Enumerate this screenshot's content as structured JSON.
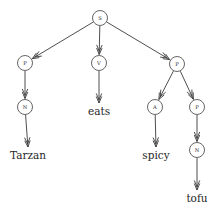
{
  "diagram": {
    "type": "parse-tree",
    "sentence": "Tarzan eats spicy tofu",
    "colors": {
      "background": "#ffffff",
      "stroke": "#3a3a3a",
      "node_stroke": "#4a4a4a",
      "node_fill": "#ffffff",
      "label_text": "#2b2b2b",
      "leaf_text": "#262626"
    },
    "nodes": [
      {
        "id": "s",
        "label": "S",
        "x": 100,
        "y": 18,
        "r": 7.5
      },
      {
        "id": "np1",
        "label": "P",
        "x": 25,
        "y": 63,
        "r": 7.5
      },
      {
        "id": "v",
        "label": "V",
        "x": 99,
        "y": 63,
        "r": 7.5
      },
      {
        "id": "np2",
        "label": "P",
        "x": 177,
        "y": 64,
        "r": 7.5
      },
      {
        "id": "n1",
        "label": "N",
        "x": 25,
        "y": 107,
        "r": 7.5
      },
      {
        "id": "a",
        "label": "A",
        "x": 155,
        "y": 107,
        "r": 7.5
      },
      {
        "id": "np3",
        "label": "P",
        "x": 197,
        "y": 107,
        "r": 7.5
      },
      {
        "id": "n2",
        "label": "N",
        "x": 197,
        "y": 150,
        "r": 7.5
      }
    ],
    "leaves": [
      {
        "id": "leaf-tarzan",
        "label": "Tarzan",
        "x": 28,
        "y": 159
      },
      {
        "id": "leaf-eats",
        "label": "eats",
        "x": 99,
        "y": 115
      },
      {
        "id": "leaf-spicy",
        "label": "spicy",
        "x": 156,
        "y": 159
      },
      {
        "id": "leaf-tofu",
        "label": "tofu",
        "x": 197,
        "y": 202
      }
    ],
    "edges": [
      {
        "id": "edge-s-np1",
        "from": "s",
        "to": "np1",
        "label": "S to left P"
      },
      {
        "id": "edge-s-v",
        "from": "s",
        "to": "v",
        "label": "S to V"
      },
      {
        "id": "edge-s-np2",
        "from": "s",
        "to": "np2",
        "label": "S to right P"
      },
      {
        "id": "edge-np1-n1",
        "from": "np1",
        "to": "n1",
        "label": "left P to N"
      },
      {
        "id": "edge-n1-tarzan",
        "from": "n1",
        "to": "leaf-tarzan",
        "label": "N to Tarzan"
      },
      {
        "id": "edge-v-eats",
        "from": "v",
        "to": "leaf-eats",
        "label": "V to eats"
      },
      {
        "id": "edge-np2-a",
        "from": "np2",
        "to": "a",
        "label": "right P to A"
      },
      {
        "id": "edge-np2-np3",
        "from": "np2",
        "to": "np3",
        "label": "right P to lower P"
      },
      {
        "id": "edge-a-spicy",
        "from": "a",
        "to": "leaf-spicy",
        "label": "A to spicy"
      },
      {
        "id": "edge-np3-n2",
        "from": "np3",
        "to": "n2",
        "label": "lower P to N"
      },
      {
        "id": "edge-n2-tofu",
        "from": "n2",
        "to": "leaf-tofu",
        "label": "N to tofu"
      }
    ]
  }
}
